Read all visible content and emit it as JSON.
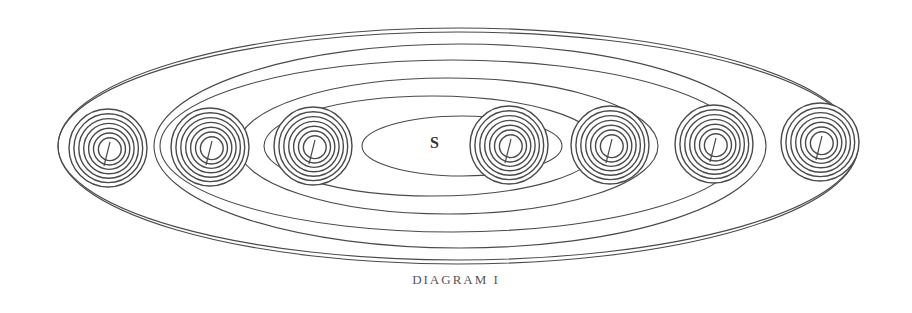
{
  "diagram": {
    "caption": "DIAGRAM I",
    "center_label": "S",
    "stroke_color": "#4a4a4a",
    "orbits": [
      {
        "cx": 462,
        "cy": 146,
        "rx": 100,
        "ry": 30
      },
      {
        "cx": 432,
        "cy": 146,
        "rx": 168,
        "ry": 50
      },
      {
        "cx": 448,
        "cy": 146,
        "rx": 210,
        "ry": 68
      },
      {
        "cx": 452,
        "cy": 146,
        "rx": 292,
        "ry": 86
      },
      {
        "cx": 460,
        "cy": 146,
        "rx": 306,
        "ry": 102
      },
      {
        "cx": 458,
        "cy": 146,
        "rx": 400,
        "ry": 114
      },
      {
        "cx": 458,
        "cy": 146,
        "rx": 400,
        "ry": 118
      }
    ],
    "planets": [
      {
        "cx": 108,
        "cy": 148,
        "r": 39
      },
      {
        "cx": 210,
        "cy": 147,
        "r": 39
      },
      {
        "cx": 313,
        "cy": 146,
        "r": 39
      },
      {
        "cx": 509,
        "cy": 145,
        "r": 39
      },
      {
        "cx": 610,
        "cy": 145,
        "r": 39
      },
      {
        "cx": 714,
        "cy": 144,
        "r": 39
      },
      {
        "cx": 820,
        "cy": 142,
        "r": 39
      }
    ]
  }
}
